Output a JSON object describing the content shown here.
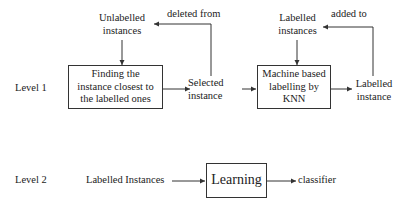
{
  "level1": {
    "level_label": "Level 1",
    "unlabelled_instances": "Unlabelled\ninstances",
    "finding_box": "Finding the\ninstance closest to\nthe labelled ones",
    "selected_instance": "Selected\ninstance",
    "deleted_from": "deleted from",
    "knn_box": "Machine based\nlabelling by\nKNN",
    "labelled_instances": "Labelled\ninstances",
    "labelled_instance": "Labelled\ninstance",
    "added_to": "added to"
  },
  "level2": {
    "level_label": "Level 2",
    "labelled_instances": "Labelled Instances",
    "learning_box": "Learning",
    "classifier": "classifier"
  },
  "colors": {
    "line": "#333333",
    "text": "#222222",
    "background": "#ffffff"
  }
}
